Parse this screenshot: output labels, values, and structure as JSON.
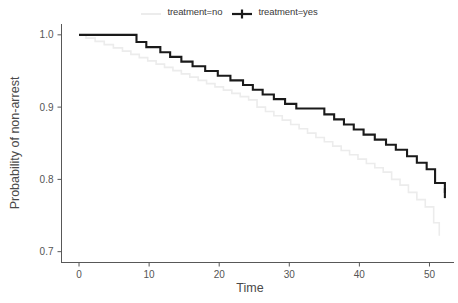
{
  "legend": {
    "position": "top",
    "entries": [
      {
        "label": "treatment=no",
        "color": "#ececec",
        "key_icon": "line-key-icon",
        "marker": "none"
      },
      {
        "label": "treatment=yes",
        "color": "#1a1a1a",
        "key_icon": "line-plus-key-icon",
        "marker": "plus"
      }
    ]
  },
  "axes": {
    "x": {
      "label": "Time",
      "ticks": [
        "0",
        "10",
        "20",
        "30",
        "40",
        "50"
      ],
      "tick_values": [
        0,
        10,
        20,
        30,
        40,
        50
      ],
      "range": [
        -2.5,
        53.5
      ]
    },
    "y": {
      "label": "Probability of non-arrest",
      "ticks": [
        "0.7",
        "0.8",
        "0.9",
        "1.0"
      ],
      "tick_values": [
        0.7,
        0.8,
        0.9,
        1.0
      ],
      "range": [
        0.685,
        1.015
      ]
    }
  },
  "chart_data": {
    "type": "line",
    "subtype": "kaplan-meier-step",
    "title": "",
    "subtitle": "",
    "xlabel": "Time",
    "ylabel": "Probability of non-arrest",
    "xlim": [
      -2.5,
      53.5
    ],
    "ylim": [
      0.685,
      1.015
    ],
    "grid": false,
    "legend_position": "top",
    "step_direction": "hv",
    "series": [
      {
        "name": "treatment=no",
        "color": "#ececec",
        "linewidth": 1.6,
        "x": [
          0,
          1,
          2.3,
          3.6,
          4.9,
          6.2,
          7.4,
          8.6,
          9.8,
          11,
          12.2,
          13.4,
          14.6,
          15.8,
          17,
          18.2,
          19.4,
          20.6,
          21.8,
          23,
          24.2,
          25.4,
          26.6,
          27.8,
          29,
          30.2,
          31.4,
          32.6,
          33.8,
          35,
          36.2,
          37.4,
          38.6,
          39.8,
          41,
          42.2,
          43.4,
          44.6,
          45.8,
          47,
          48.2,
          49.4,
          50.6,
          51.4
        ],
        "y": [
          1.0,
          0.9955,
          0.991,
          0.9865,
          0.982,
          0.9775,
          0.973,
          0.9685,
          0.964,
          0.9595,
          0.955,
          0.9505,
          0.946,
          0.9415,
          0.937,
          0.9325,
          0.928,
          0.9235,
          0.919,
          0.9145,
          0.91,
          0.9,
          0.894,
          0.888,
          0.882,
          0.876,
          0.87,
          0.864,
          0.858,
          0.852,
          0.846,
          0.84,
          0.834,
          0.828,
          0.822,
          0.816,
          0.81,
          0.8,
          0.792,
          0.782,
          0.772,
          0.762,
          0.74,
          0.722
        ],
        "censor_marks": []
      },
      {
        "name": "treatment=yes",
        "color": "#1a1a1a",
        "linewidth": 2.1,
        "x": [
          0,
          6.8,
          8.2,
          9.6,
          11.6,
          13.0,
          14.6,
          16.2,
          18.0,
          19.8,
          21.6,
          23.4,
          24.8,
          26.2,
          27.8,
          29.4,
          31.0,
          32.4,
          33.8,
          35.0,
          36.4,
          37.8,
          39.2,
          40.6,
          42.2,
          43.8,
          45.2,
          46.8,
          48.2,
          49.6,
          50.8,
          52.2
        ],
        "y": [
          1.0,
          1.0,
          0.99,
          0.983,
          0.976,
          0.9695,
          0.963,
          0.9565,
          0.95,
          0.9435,
          0.937,
          0.9305,
          0.924,
          0.9175,
          0.911,
          0.9045,
          0.898,
          0.898,
          0.898,
          0.89,
          0.883,
          0.876,
          0.869,
          0.862,
          0.855,
          0.848,
          0.841,
          0.832,
          0.823,
          0.814,
          0.795,
          0.781
        ],
        "censor_marks": [
          {
            "x": 52.2,
            "y": 0.781
          }
        ]
      }
    ]
  }
}
